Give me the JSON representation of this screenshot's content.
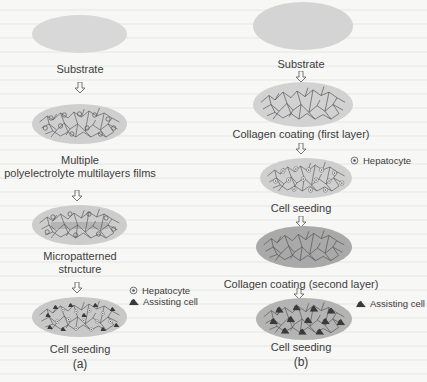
{
  "colors": {
    "disc_light": "#d6d6d6",
    "disc_mid": "#c9c9c9",
    "disc_dark": "#a9a9a9",
    "fiber": "#4a4a4a",
    "cell_dark": "#3a3a3a",
    "text": "#3c3c3c"
  },
  "panel_a": {
    "steps": [
      {
        "label": "Substrate"
      },
      {
        "label_line1": "Multiple",
        "label_line2": "polyelectrolyte multilayers films"
      },
      {
        "label_line1": "Micropatterned",
        "label_line2": "structure"
      },
      {
        "label": "Cell seeding"
      }
    ],
    "legend": {
      "hepatocyte": "Hepatocyte",
      "assisting_cell": "Assisting cell"
    },
    "caption": "(a)"
  },
  "panel_b": {
    "steps": [
      {
        "label": "Substrate"
      },
      {
        "label": "Collagen coating (first layer)"
      },
      {
        "label": "Cell seeding"
      },
      {
        "label": "Collagen coating (second layer)"
      },
      {
        "label": "Cell seeding"
      }
    ],
    "legend": {
      "hepatocyte": "Hepatocyte",
      "assisting_cell": "Assisting cell"
    },
    "caption": "(b)"
  },
  "icons": {
    "arrow": "hollow-down-arrow",
    "hepatocyte": "circle-with-dot",
    "assisting_cell": "dark-triangle-mound"
  }
}
